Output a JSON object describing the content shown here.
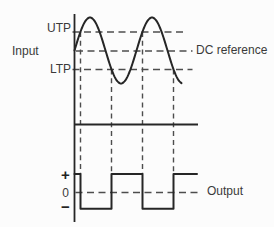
{
  "figure": {
    "name": "comparator-hysteresis-waveform-diagram",
    "colors": {
      "background": "#fcfcfc",
      "ink": "#262626",
      "dashed": "#4d4d4d",
      "text": "#3a3a3a"
    },
    "labels": {
      "input": "Input",
      "utp": "UTP",
      "ltp": "LTP",
      "dc_reference": "DC reference",
      "output": "Output",
      "plus": "+",
      "zero": "0",
      "minus": "−"
    },
    "waveforms": {
      "input_sine": {
        "x_start": 74.5,
        "x_end": 182,
        "center_y": 50.5,
        "amplitude_px": 33,
        "period_px": 62,
        "zero_cross_x": 74.5
      },
      "levels_y": {
        "utp": 32,
        "dc_reference": 51,
        "ltp": 69.5,
        "plus": 174,
        "zero": 192.5,
        "minus": 208.8
      },
      "switch_points_x": [
        80.5,
        111.5,
        142.5,
        173.5
      ],
      "output_square": {
        "x_start": 74.5,
        "x_end": 197,
        "start_level": "plus"
      }
    },
    "axes": {
      "vertical_x": 74.5,
      "vertical_y_top": 14,
      "vertical_y_bottom": 222,
      "mid_line_y": 124.5,
      "mid_line_x_end": 198
    },
    "dashed_extents": {
      "utp_x1": 72.5,
      "utp_x2": 187,
      "dc_x1": 76,
      "dc_x2": 192.5,
      "ltp_x1": 72.5,
      "ltp_x2": 192.5,
      "zero_x1": 75.5,
      "zero_x2": 200.5
    }
  }
}
